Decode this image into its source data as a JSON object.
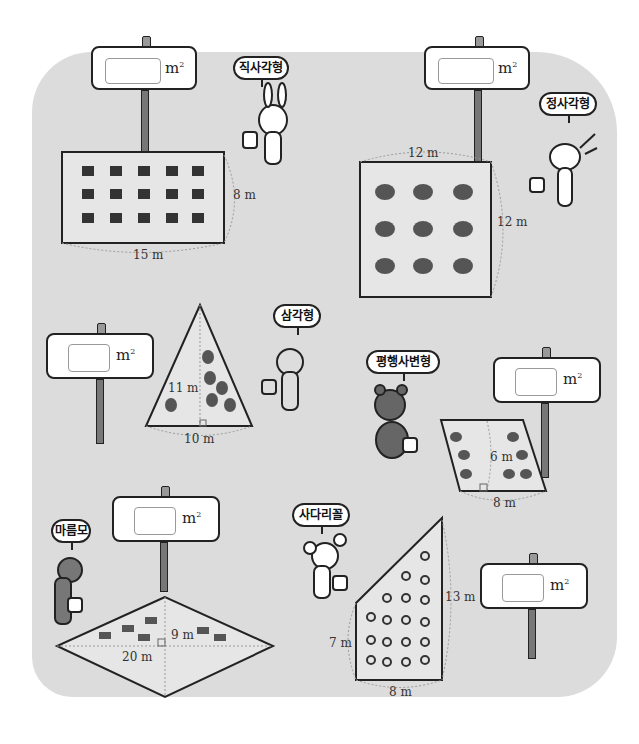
{
  "signs": [
    {
      "id": "rectangle",
      "unit": "m",
      "unit_sup": "2",
      "answer": ""
    },
    {
      "id": "square",
      "unit": "m",
      "unit_sup": "2",
      "answer": ""
    },
    {
      "id": "triangle",
      "unit": "m",
      "unit_sup": "2",
      "answer": ""
    },
    {
      "id": "parallelogram",
      "unit": "m",
      "unit_sup": "2",
      "answer": ""
    },
    {
      "id": "rhombus",
      "unit": "m",
      "unit_sup": "2",
      "answer": ""
    },
    {
      "id": "trapezoid",
      "unit": "m",
      "unit_sup": "2",
      "answer": ""
    }
  ],
  "characters": {
    "rabbit": {
      "speech": "직사각형"
    },
    "dog": {
      "speech": "정사각형"
    },
    "cat": {
      "speech": "삼각형"
    },
    "bear": {
      "speech": "평행사변형"
    },
    "wolf": {
      "speech": "마름모"
    },
    "poodle": {
      "speech": "사다리꼴"
    }
  },
  "shapes": {
    "rectangle": {
      "width": "15 m",
      "height": "8 m"
    },
    "square": {
      "top": "12 m",
      "side": "12 m"
    },
    "triangle": {
      "height": "11 m",
      "base": "10 m"
    },
    "parallelogram": {
      "height": "6 m",
      "base": "8 m"
    },
    "rhombus": {
      "diag_short": "9 m",
      "diag_long": "20 m"
    },
    "trapezoid": {
      "long_side": "13 m",
      "short_side": "7 m",
      "height": "8 m"
    }
  },
  "colors": {
    "background": "#dcdcdc",
    "field": "#e6e6e6",
    "outline": "#222222"
  }
}
